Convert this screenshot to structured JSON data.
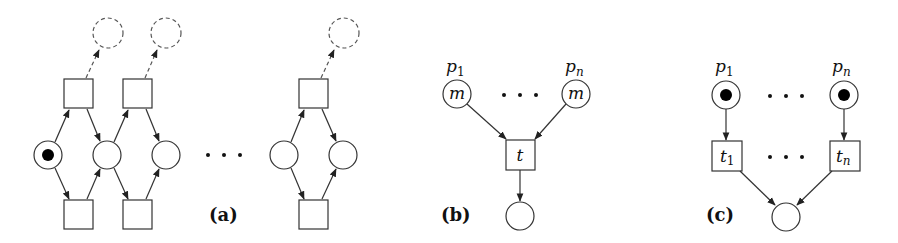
{
  "figure": {
    "panels": [
      {
        "id": "a",
        "label": "(a)"
      },
      {
        "id": "b",
        "label": "(b)"
      },
      {
        "id": "c",
        "label": "(c)"
      }
    ],
    "panel_b": {
      "place_labels": {
        "first": "p",
        "first_sub": "1",
        "last": "p",
        "last_sub": "n"
      },
      "place_marking": "m",
      "transition_label": "t"
    },
    "panel_c": {
      "place_labels": {
        "first": "p",
        "first_sub": "1",
        "last": "p",
        "last_sub": "n"
      },
      "transition_labels": {
        "first": "t",
        "first_sub": "1",
        "last": "t",
        "last_sub": "n"
      }
    },
    "colors": {
      "stroke": "#333333",
      "token": "#000000",
      "dashed": "#555555"
    }
  }
}
